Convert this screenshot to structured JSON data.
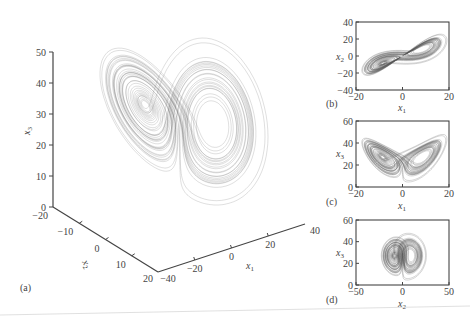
{
  "figure": {
    "bottom_rule_color": "#d8d8d8",
    "trajectory_color": "#555555"
  },
  "chart_data": [
    {
      "id": "a",
      "type": "line",
      "subtype": "3d-trajectory",
      "panel_label": "(a)",
      "title": "",
      "description": "Lorenz chaotic attractor, 3D view",
      "axes": {
        "x1": {
          "label": "x",
          "sub": "1",
          "ticks": [
            "-40",
            "-20",
            "0",
            "20",
            "40"
          ],
          "range": [
            -40,
            40
          ]
        },
        "x2": {
          "label": "x",
          "sub": "2",
          "ticks": [
            "-20",
            "-10",
            "0",
            "10",
            "20"
          ],
          "range": [
            -20,
            20
          ]
        },
        "x3": {
          "label": "x",
          "sub": "3",
          "ticks": [
            "0",
            "10",
            "20",
            "30",
            "40",
            "50"
          ],
          "range": [
            0,
            50
          ]
        }
      },
      "grid": false,
      "legend": null
    },
    {
      "id": "b",
      "type": "line",
      "subtype": "phase-portrait",
      "panel_label": "(b)",
      "xlabel": {
        "label": "x",
        "sub": "1"
      },
      "ylabel": {
        "label": "x",
        "sub": "2"
      },
      "xticks": [
        "-20",
        "0",
        "20"
      ],
      "yticks": [
        "-40",
        "-20",
        "0",
        "20",
        "40"
      ],
      "xlim": [
        -20,
        20
      ],
      "ylim": [
        -40,
        40
      ],
      "grid": false
    },
    {
      "id": "c",
      "type": "line",
      "subtype": "phase-portrait",
      "panel_label": "(c)",
      "xlabel": {
        "label": "x",
        "sub": "1"
      },
      "ylabel": {
        "label": "x",
        "sub": "3"
      },
      "xticks": [
        "-20",
        "0",
        "20"
      ],
      "yticks": [
        "0",
        "20",
        "40",
        "60"
      ],
      "xlim": [
        -20,
        20
      ],
      "ylim": [
        0,
        60
      ],
      "grid": false
    },
    {
      "id": "d",
      "type": "line",
      "subtype": "phase-portrait",
      "panel_label": "(d)",
      "xlabel": {
        "label": "x",
        "sub": "2"
      },
      "ylabel": {
        "label": "x",
        "sub": "3"
      },
      "xticks": [
        "-50",
        "0",
        "50"
      ],
      "yticks": [
        "0",
        "20",
        "40",
        "60"
      ],
      "xlim": [
        -50,
        50
      ],
      "ylim": [
        0,
        60
      ],
      "grid": false
    }
  ]
}
